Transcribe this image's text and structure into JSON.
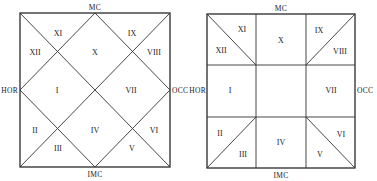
{
  "charts": [
    {
      "name": "north-indian-diamond-chart",
      "axis_labels": {
        "top": "MC",
        "bottom": "IMC",
        "left": "HOR",
        "right": "OCC"
      },
      "houses": [
        "I",
        "II",
        "III",
        "IV",
        "V",
        "VI",
        "VII",
        "VIII",
        "IX",
        "X",
        "XI",
        "XII"
      ]
    },
    {
      "name": "grid-square-chart",
      "axis_labels": {
        "top": "MC",
        "bottom": "IMC",
        "left": "HOR",
        "right": "OCC"
      },
      "houses": [
        "I",
        "II",
        "III",
        "IV",
        "V",
        "VI",
        "VII",
        "VIII",
        "IX",
        "X",
        "XI",
        "XII"
      ]
    }
  ]
}
